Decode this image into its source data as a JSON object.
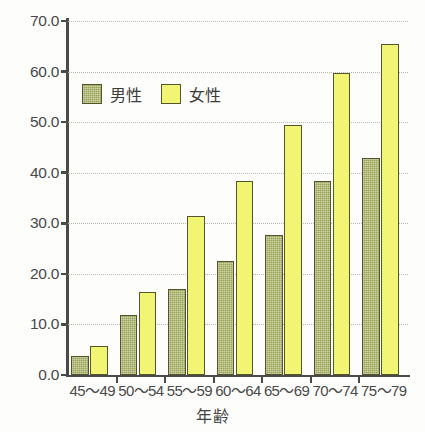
{
  "chart_data": {
    "type": "bar",
    "title": "",
    "subtitle": "",
    "xlabel": "年齢",
    "ylabel": "",
    "categories": [
      "45～49",
      "50～54",
      "55～59",
      "60～64",
      "65～69",
      "70～74",
      "75～79"
    ],
    "series": [
      {
        "name": "男性",
        "color": "#9aa352",
        "values": [
          3.8,
          11.9,
          17.0,
          22.5,
          27.7,
          38.3,
          43.0
        ]
      },
      {
        "name": "女性",
        "color": "#f2f573",
        "values": [
          5.8,
          16.4,
          31.4,
          38.3,
          49.4,
          59.7,
          65.4
        ]
      }
    ],
    "ylim": [
      0.0,
      70.0
    ],
    "ytick_step": 10.0,
    "ytick_labels": [
      "70.0",
      "60.0",
      "50.0",
      "40.0",
      "30.0",
      "20.0",
      "10.0",
      "0.0"
    ],
    "ytick_values": [
      70.0,
      60.0,
      50.0,
      40.0,
      30.0,
      20.0,
      10.0,
      0.0
    ],
    "grid": true,
    "grid_style": "dotted",
    "legend_position": "upper-left-inside"
  },
  "legend": {
    "entries": [
      {
        "label": "男性"
      },
      {
        "label": "女性"
      }
    ]
  },
  "axes": {
    "x_title": "年齢"
  }
}
